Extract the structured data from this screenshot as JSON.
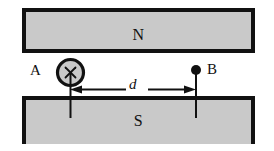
{
  "figure": {
    "background_color": "#ffffff",
    "ink_color": "#111111",
    "pole_fill_color": "#c9c9c9"
  },
  "poles": {
    "north": {
      "label": "N",
      "name": "north-pole"
    },
    "south": {
      "label": "S",
      "name": "south-pole"
    }
  },
  "points": {
    "a": {
      "label": "A",
      "marker": "circled-cross-icon",
      "meaning": "×"
    },
    "b": {
      "label": "B",
      "marker": "filled-dot-icon",
      "meaning": "•"
    }
  },
  "dimension": {
    "label": "d",
    "from": "A",
    "to": "B"
  }
}
